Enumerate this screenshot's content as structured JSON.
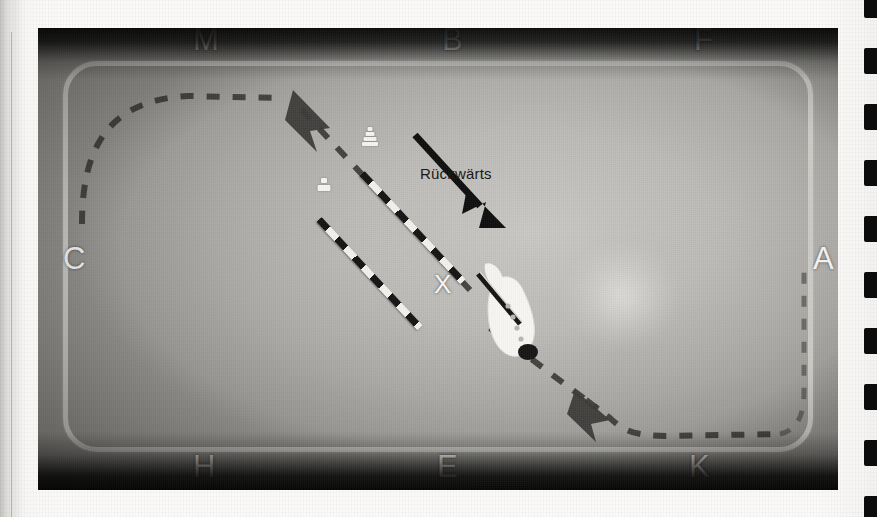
{
  "page": {
    "background_color": "#fbfaf8",
    "binding_tab_color": "#0c0c0c",
    "binding_tab_count": 9
  },
  "photo": {
    "surface_label": "sand arena surface",
    "fence_color": "#d0cfcb",
    "vignette": "dark"
  },
  "arena": {
    "letters": [
      {
        "name": "letter-m",
        "label": "M",
        "x": 193,
        "y": 36
      },
      {
        "name": "letter-b",
        "label": "B",
        "x": 442,
        "y": 36
      },
      {
        "name": "letter-f",
        "label": "F",
        "x": 694,
        "y": 36
      },
      {
        "name": "letter-c",
        "label": "C",
        "x": 63,
        "y": 258
      },
      {
        "name": "letter-a",
        "label": "A",
        "x": 817,
        "y": 258
      },
      {
        "name": "letter-h",
        "label": "H",
        "x": 193,
        "y": 462
      },
      {
        "name": "letter-e",
        "label": "E",
        "x": 437,
        "y": 462
      },
      {
        "name": "letter-k",
        "label": "K",
        "x": 689,
        "y": 462
      }
    ],
    "center_marker": {
      "name": "marker-x",
      "label": "X"
    }
  },
  "annotations": {
    "direction_label": "Rückwärts",
    "direction_arrow": "diagonal-down-right"
  },
  "equipment": {
    "poles": [
      {
        "name": "cavaletti-pole-upper",
        "stripe_colors": [
          "#141414",
          "#f3f2ef"
        ],
        "length_px": 148,
        "angle_deg": 47
      },
      {
        "name": "cavaletti-pole-lower",
        "stripe_colors": [
          "#141414",
          "#f3f2ef"
        ],
        "length_px": 148,
        "angle_deg": 47
      }
    ],
    "cones": [
      {
        "name": "cone-upper",
        "color": "#f6f5f2"
      },
      {
        "name": "cone-lower",
        "color": "#f6f5f2"
      }
    ],
    "figure": {
      "name": "horse-and-rider",
      "color": "#f7f6f3"
    }
  },
  "path": {
    "style": "dashed",
    "color": "#3b3a38",
    "arrow_count": 2,
    "arrows": [
      {
        "name": "path-arrow-upper-left",
        "direction": "up-left"
      },
      {
        "name": "path-arrow-lower-right",
        "direction": "up-left"
      }
    ]
  }
}
